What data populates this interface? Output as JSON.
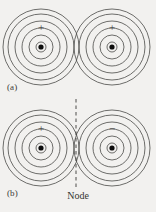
{
  "figure": {
    "background_color": "#f2f1ef",
    "line_color": "#4a4a48",
    "nucleus_color": "#0d0d0d",
    "node_line_color": "#3a3a38",
    "panels": [
      {
        "id": "a",
        "label": "(a)",
        "description": "Bonding combination: two in-phase atomic orbitals overlap constructively",
        "has_node": false,
        "atoms": [
          {
            "side": "left",
            "sign": "+",
            "center_x": 41,
            "center_y": 47,
            "ring_radii": [
              5,
              12,
              19,
              26,
              33,
              38
            ],
            "nucleus_radius": 2.6
          },
          {
            "side": "right",
            "sign": "+",
            "center_x": 112,
            "center_y": 47,
            "ring_radii": [
              5,
              12,
              19,
              26,
              33,
              38
            ],
            "nucleus_radius": 2.6
          }
        ]
      },
      {
        "id": "b",
        "label": "(b)",
        "description": "Antibonding combination: two out-of-phase atomic orbitals produce a node",
        "has_node": true,
        "node_label": "Node",
        "node_x": 76,
        "node_top": 99,
        "node_bottom": 190,
        "atoms": [
          {
            "side": "left",
            "sign": "+",
            "center_x": 41,
            "center_y": 148,
            "ring_radii": [
              5,
              12,
              19,
              26,
              33,
              38
            ],
            "nucleus_radius": 2.6
          },
          {
            "side": "right",
            "sign": "−",
            "center_x": 112,
            "center_y": 148,
            "ring_radii": [
              5,
              12,
              19,
              26,
              33,
              38
            ],
            "nucleus_radius": 2.6
          }
        ]
      }
    ]
  }
}
